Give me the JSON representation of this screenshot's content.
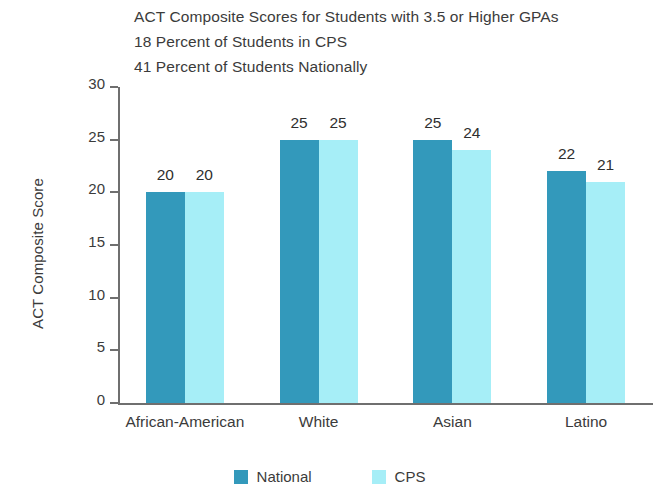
{
  "title_lines": [
    "ACT Composite Scores for Students with 3.5 or Higher GPAs",
    "18 Percent of Students in CPS",
    "41 Percent of Students Nationally"
  ],
  "chart_data": {
    "type": "bar",
    "title": "ACT Composite Scores for Students with 3.5 or Higher GPAs",
    "subtitle_lines": [
      "18 Percent of Students in CPS",
      "41 Percent of Students Nationally"
    ],
    "xlabel": "",
    "ylabel": "ACT Composite Score",
    "ylim": [
      0,
      30
    ],
    "yticks": [
      0,
      5,
      10,
      15,
      20,
      25,
      30
    ],
    "ytick_labels": [
      "0",
      "5",
      "10",
      "15",
      "20",
      "25",
      "30"
    ],
    "grid": false,
    "legend_position": "bottom-center",
    "categories": [
      "African-American",
      "White",
      "Asian",
      "Latino"
    ],
    "series": [
      {
        "name": "National",
        "color": "#3399BB",
        "values": [
          20,
          25,
          25,
          22
        ],
        "value_labels": [
          "20",
          "25",
          "25",
          "22"
        ]
      },
      {
        "name": "CPS",
        "color": "#A6EEF7",
        "values": [
          20,
          25,
          24,
          21
        ],
        "value_labels": [
          "20",
          "25",
          "24",
          "21"
        ]
      }
    ]
  },
  "axis": {
    "y_title": "ACT Composite Score",
    "line_color": "#6f6f6f"
  },
  "legend": {
    "items": [
      {
        "label": "National",
        "color": "#3399BB"
      },
      {
        "label": "CPS",
        "color": "#A6EEF7"
      }
    ]
  }
}
